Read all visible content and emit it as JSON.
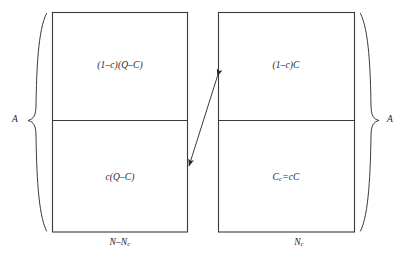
{
  "figure": {
    "type": "diagram",
    "background_color": "#ffffff",
    "line_color": "#3a3a3a",
    "text_color": "#1f1f1f",
    "left_box": {
      "name": "non-capitalist-sector",
      "upper_cell": "(1–c)(Q–C)",
      "lower_cell": "c(Q–C)",
      "width_label": "N–N",
      "width_label_sub": "c",
      "height_label": "A"
    },
    "right_box": {
      "name": "capitalist-sector",
      "upper_cell": "(1–c)C",
      "lower_cell_lhs": "C",
      "lower_cell_lhs_sub": "c",
      "lower_cell_rhs": "=cC",
      "width_label": "N",
      "width_label_sub": "c",
      "height_label": "A"
    },
    "arrow": {
      "name": "exchange-arrow",
      "style": "double-headed",
      "from": "left-box-lower-region",
      "to": "right-box-upper-region"
    }
  }
}
